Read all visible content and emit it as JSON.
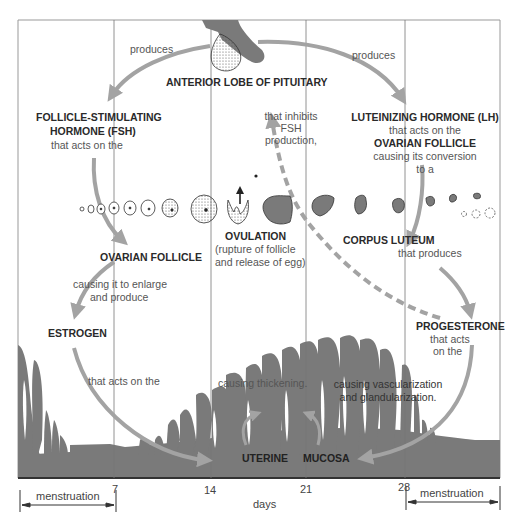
{
  "pituitary": {
    "label": "ANTERIOR LOBE OF PITUITARY"
  },
  "arrows": {
    "produces_left": "produces",
    "produces_right": "produces"
  },
  "fsh": {
    "title_line1": "FOLLICLE-STIMULATING",
    "title_line2": "HORMONE (FSH)",
    "desc": "that acts on the"
  },
  "lh": {
    "title": "LUTEINIZING HORMONE (LH)",
    "desc1": "that acts on the",
    "target": "OVARIAN FOLLICLE",
    "desc2": "causing its conversion",
    "desc3": "to a"
  },
  "inhibit": {
    "line1": "that inhibits",
    "line2": "FSH",
    "line3": "production,"
  },
  "follicle": {
    "title": "OVARIAN FOLLICLE",
    "desc1": "causing it to enlarge",
    "desc2": "and produce"
  },
  "ovulation": {
    "title": "OVULATION",
    "desc1": "(rupture of follicle",
    "desc2": "and release of egg)"
  },
  "corpus": {
    "title": "CORPUS LUTEUM",
    "desc": "that produces"
  },
  "estrogen": {
    "title": "ESTROGEN",
    "desc": "that acts on the",
    "effect": "causing thickening."
  },
  "progesterone": {
    "title": "PROGESTERONE",
    "desc1": "that acts",
    "desc2": "on the",
    "effect1": "causing vascularization",
    "effect2": "and glandularization."
  },
  "mucosa": {
    "word1": "UTERINE",
    "word2": "MUCOSA"
  },
  "axis": {
    "ticks": [
      "7",
      "14",
      "21",
      "28"
    ],
    "label": "days",
    "menstruation_left": "menstruation",
    "menstruation_right": "menstruation"
  },
  "colors": {
    "tissue": "#7a7a7a",
    "arrow": "#a3a3a3",
    "frame": "#888888",
    "baseline": "#333333"
  }
}
